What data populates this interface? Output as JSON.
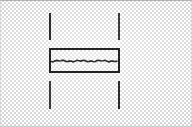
{
  "figure": {
    "kind": "technical-line-drawing",
    "render_style": "scanned-halftone-dither",
    "canvas": {
      "width": 192,
      "height": 127
    },
    "background_color": "#d9d9d9",
    "paper_color": "#ffffff",
    "ink_color": "#232323",
    "caption": ""
  },
  "frame": {
    "top_color": "#9aa0a6",
    "bottom_color": "#b5b9bd",
    "side_color": "#c2c6ca"
  },
  "geometry": {
    "section_rect": {
      "name": "section-rectangle",
      "x": 49,
      "y": 48,
      "width": 71,
      "height": 25,
      "stroke_width": 2,
      "stroke_color": "#232323",
      "fill": "none"
    },
    "interior_divider": {
      "name": "interior-divider-line",
      "x": 51,
      "y": 59,
      "width": 67,
      "stroke_color": "#2a2a2a",
      "style": "irregular-wavy"
    },
    "vertical_lines": [
      {
        "name": "guide-line-upper-left",
        "x": 49,
        "y": 13,
        "height": 27,
        "stroke_color": "#2b2b2b",
        "stroke_width": 2
      },
      {
        "name": "guide-line-upper-right",
        "x": 118,
        "y": 13,
        "height": 27,
        "stroke_color": "#3a3a3a",
        "stroke_width": 2
      },
      {
        "name": "guide-line-lower-left",
        "x": 49,
        "y": 81,
        "height": 28,
        "stroke_color": "#3a3a3a",
        "stroke_width": 2
      },
      {
        "name": "guide-line-lower-right",
        "x": 118,
        "y": 81,
        "height": 28,
        "stroke_color": "#2b2b2b",
        "stroke_width": 2
      }
    ]
  },
  "labels": {
    "visible_text": []
  }
}
